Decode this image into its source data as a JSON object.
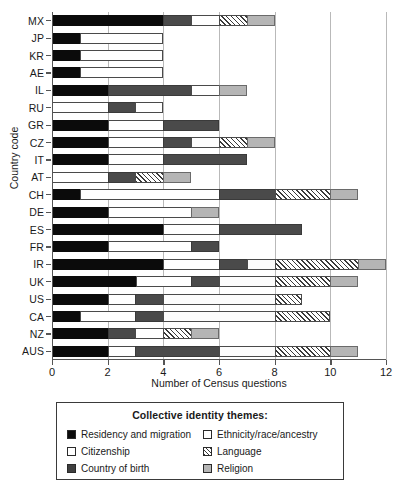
{
  "chart_data": {
    "type": "bar",
    "orientation": "horizontal",
    "stacked": true,
    "title": "",
    "xlabel": "Number of Census questions",
    "ylabel": "Country code",
    "xlim": [
      0,
      12
    ],
    "xticks": [
      0,
      2,
      4,
      6,
      8,
      10,
      12
    ],
    "xtick_labels": [
      "0",
      "2",
      "4",
      "6",
      "8",
      "10",
      "12"
    ],
    "grid": "vertical-major",
    "legend_position": "below-axes",
    "legend_title": "Collective identity themes:",
    "series": [
      {
        "name": "Residency and migration",
        "key": "residency",
        "pattern": "solid-black"
      },
      {
        "name": "Citizenship",
        "key": "citizenship",
        "pattern": "solid-white"
      },
      {
        "name": "Country of birth",
        "key": "birth",
        "pattern": "solid-dark-gray"
      },
      {
        "name": "Ethnicity/race/ancestry",
        "key": "ethnicity",
        "pattern": "solid-white"
      },
      {
        "name": "Language",
        "key": "language",
        "pattern": "diagonal-hatch"
      },
      {
        "name": "Religion",
        "key": "religion",
        "pattern": "solid-light-gray"
      }
    ],
    "categories": [
      "MX",
      "JP",
      "KR",
      "AE",
      "IL",
      "RU",
      "GR",
      "CZ",
      "IT",
      "AT",
      "CH",
      "DE",
      "ES",
      "FR",
      "IR",
      "UK",
      "US",
      "CA",
      "NZ",
      "AUS"
    ],
    "bars": [
      {
        "category": "MX",
        "total": 8,
        "segments": [
          {
            "key": "residency",
            "value": 4
          },
          {
            "key": "birth",
            "value": 1
          },
          {
            "key": "citizenship",
            "value": 1
          },
          {
            "key": "language",
            "value": 1
          },
          {
            "key": "religion",
            "value": 1
          }
        ]
      },
      {
        "category": "JP",
        "total": 4,
        "segments": [
          {
            "key": "residency",
            "value": 1
          },
          {
            "key": "citizenship",
            "value": 3
          }
        ]
      },
      {
        "category": "KR",
        "total": 4,
        "segments": [
          {
            "key": "residency",
            "value": 1
          },
          {
            "key": "citizenship",
            "value": 3
          }
        ]
      },
      {
        "category": "AE",
        "total": 4,
        "segments": [
          {
            "key": "residency",
            "value": 1
          },
          {
            "key": "citizenship",
            "value": 3
          }
        ]
      },
      {
        "category": "IL",
        "total": 7,
        "segments": [
          {
            "key": "residency",
            "value": 2
          },
          {
            "key": "birth",
            "value": 3
          },
          {
            "key": "citizenship",
            "value": 1
          },
          {
            "key": "religion",
            "value": 1
          }
        ]
      },
      {
        "category": "RU",
        "total": 4,
        "segments": [
          {
            "key": "citizenship",
            "value": 2
          },
          {
            "key": "birth",
            "value": 1
          },
          {
            "key": "citizenship",
            "value": 1
          }
        ]
      },
      {
        "category": "GR",
        "total": 6,
        "segments": [
          {
            "key": "residency",
            "value": 2
          },
          {
            "key": "citizenship",
            "value": 2
          },
          {
            "key": "birth",
            "value": 2
          }
        ]
      },
      {
        "category": "CZ",
        "total": 8,
        "segments": [
          {
            "key": "residency",
            "value": 2
          },
          {
            "key": "citizenship",
            "value": 2
          },
          {
            "key": "birth",
            "value": 1
          },
          {
            "key": "ethnicity",
            "value": 1
          },
          {
            "key": "language",
            "value": 1
          },
          {
            "key": "religion",
            "value": 1
          }
        ]
      },
      {
        "category": "IT",
        "total": 7,
        "segments": [
          {
            "key": "residency",
            "value": 2
          },
          {
            "key": "citizenship",
            "value": 2
          },
          {
            "key": "birth",
            "value": 3
          }
        ]
      },
      {
        "category": "AT",
        "total": 5,
        "segments": [
          {
            "key": "citizenship",
            "value": 2
          },
          {
            "key": "birth",
            "value": 1
          },
          {
            "key": "language",
            "value": 1
          },
          {
            "key": "religion",
            "value": 1
          }
        ]
      },
      {
        "category": "CH",
        "total": 11,
        "segments": [
          {
            "key": "residency",
            "value": 1
          },
          {
            "key": "citizenship",
            "value": 5
          },
          {
            "key": "birth",
            "value": 2
          },
          {
            "key": "language",
            "value": 2
          },
          {
            "key": "religion",
            "value": 1
          }
        ]
      },
      {
        "category": "DE",
        "total": 6,
        "segments": [
          {
            "key": "residency",
            "value": 2
          },
          {
            "key": "citizenship",
            "value": 3
          },
          {
            "key": "religion",
            "value": 1
          }
        ]
      },
      {
        "category": "ES",
        "total": 9,
        "segments": [
          {
            "key": "residency",
            "value": 4
          },
          {
            "key": "citizenship",
            "value": 2
          },
          {
            "key": "birth",
            "value": 3
          }
        ]
      },
      {
        "category": "FR",
        "total": 6,
        "segments": [
          {
            "key": "residency",
            "value": 2
          },
          {
            "key": "citizenship",
            "value": 3
          },
          {
            "key": "birth",
            "value": 1
          }
        ]
      },
      {
        "category": "IR",
        "total": 12,
        "segments": [
          {
            "key": "residency",
            "value": 4
          },
          {
            "key": "citizenship",
            "value": 2
          },
          {
            "key": "birth",
            "value": 1
          },
          {
            "key": "ethnicity",
            "value": 1
          },
          {
            "key": "language",
            "value": 3
          },
          {
            "key": "religion",
            "value": 1
          }
        ]
      },
      {
        "category": "UK",
        "total": 11,
        "segments": [
          {
            "key": "residency",
            "value": 3
          },
          {
            "key": "citizenship",
            "value": 2
          },
          {
            "key": "birth",
            "value": 1
          },
          {
            "key": "ethnicity",
            "value": 2
          },
          {
            "key": "language",
            "value": 2
          },
          {
            "key": "religion",
            "value": 1
          }
        ]
      },
      {
        "category": "US",
        "total": 9,
        "segments": [
          {
            "key": "residency",
            "value": 2
          },
          {
            "key": "citizenship",
            "value": 1
          },
          {
            "key": "birth",
            "value": 1
          },
          {
            "key": "ethnicity",
            "value": 4
          },
          {
            "key": "language",
            "value": 1
          }
        ]
      },
      {
        "category": "CA",
        "total": 10,
        "segments": [
          {
            "key": "residency",
            "value": 1
          },
          {
            "key": "citizenship",
            "value": 2
          },
          {
            "key": "birth",
            "value": 1
          },
          {
            "key": "ethnicity",
            "value": 4
          },
          {
            "key": "language",
            "value": 2
          }
        ]
      },
      {
        "category": "NZ",
        "total": 6,
        "segments": [
          {
            "key": "residency",
            "value": 2
          },
          {
            "key": "birth",
            "value": 1
          },
          {
            "key": "citizenship",
            "value": 1
          },
          {
            "key": "language",
            "value": 1
          },
          {
            "key": "religion",
            "value": 1
          }
        ]
      },
      {
        "category": "AUS",
        "total": 11,
        "segments": [
          {
            "key": "residency",
            "value": 2
          },
          {
            "key": "citizenship",
            "value": 1
          },
          {
            "key": "birth",
            "value": 3
          },
          {
            "key": "ethnicity",
            "value": 2
          },
          {
            "key": "language",
            "value": 2
          },
          {
            "key": "religion",
            "value": 1
          }
        ]
      }
    ]
  },
  "axes": {
    "y_title": "Country code",
    "x_title": "Number of Census questions"
  },
  "legend": {
    "title": "Collective identity themes:",
    "items": [
      {
        "label": "Residency and migration",
        "key": "residency"
      },
      {
        "label": "Ethnicity/race/ancestry",
        "key": "ethnicity"
      },
      {
        "label": "Citizenship",
        "key": "citizenship"
      },
      {
        "label": "Language",
        "key": "language"
      },
      {
        "label": "Country of birth",
        "key": "birth"
      },
      {
        "label": "Religion",
        "key": "religion"
      }
    ]
  },
  "colors": {
    "residency": "#0b0b0b",
    "citizenship": "#ffffff",
    "birth": "#4a4a4a",
    "ethnicity": "#fcfcfc",
    "language": "#ffffff",
    "religion": "#b5b5b5",
    "grid": "#b9b9b9",
    "axis": "#555555"
  }
}
